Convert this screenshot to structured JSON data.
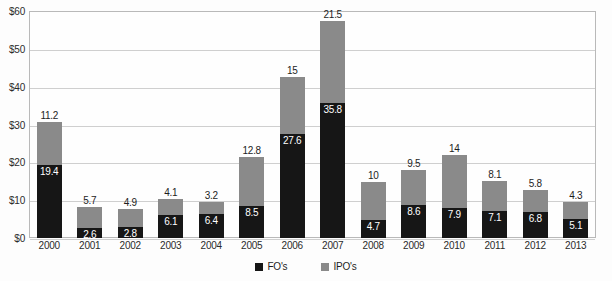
{
  "chart_data": {
    "type": "bar",
    "subtype": "stacked-column",
    "title": "",
    "xlabel": "",
    "ylabel": "",
    "ylim": [
      0,
      60
    ],
    "ytick_step": 10,
    "ytick_labels": [
      "$0",
      "$10",
      "$20",
      "$30",
      "$40",
      "$50",
      "$60"
    ],
    "ytick_values": [
      0,
      10,
      20,
      30,
      40,
      50,
      60
    ],
    "grid": true,
    "legend_position": "bottom-center",
    "categories": [
      "2000",
      "2001",
      "2002",
      "2003",
      "2004",
      "2005",
      "2006",
      "2007",
      "2008",
      "2009",
      "2010",
      "2011",
      "2012",
      "2013"
    ],
    "series": [
      {
        "name": "FO's",
        "color": "#161616",
        "stack_order": "bottom",
        "values": [
          19.4,
          2.6,
          2.8,
          6.1,
          6.4,
          8.5,
          27.6,
          35.8,
          4.7,
          8.6,
          7.9,
          7.1,
          6.8,
          5.1
        ],
        "labels": [
          "19.4",
          "2.6",
          "2.8",
          "6.1",
          "6.4",
          "8.5",
          "27.6",
          "35.8",
          "4.7",
          "8.6",
          "7.9",
          "7.1",
          "6.8",
          "5.1"
        ]
      },
      {
        "name": "IPO's",
        "color": "#8a8a8a",
        "stack_order": "top",
        "values": [
          11.2,
          5.7,
          4.9,
          4.1,
          3.2,
          12.8,
          15,
          21.5,
          10,
          9.5,
          14,
          8.1,
          5.8,
          4.3
        ],
        "labels": [
          "11.2",
          "5.7",
          "4.9",
          "4.1",
          "3.2",
          "12.8",
          "15",
          "21.5",
          "10",
          "9.5",
          "14",
          "8.1",
          "5.8",
          "4.3"
        ]
      }
    ],
    "totals": [
      30.6,
      8.3,
      7.7,
      10.2,
      9.6,
      21.3,
      42.6,
      57.3,
      14.7,
      18.1,
      21.9,
      15.2,
      12.6,
      9.4
    ]
  },
  "legend": {
    "items": [
      {
        "label": "FO's",
        "color": "#161616"
      },
      {
        "label": "IPO's",
        "color": "#8a8a8a"
      }
    ]
  },
  "colors": {
    "fo": "#161616",
    "ipo": "#8a8a8a",
    "gridline": "#cfcfcf",
    "plot_border": "#b9b9b9",
    "text": "#1d1d1d",
    "background": "#fdfdfd"
  }
}
